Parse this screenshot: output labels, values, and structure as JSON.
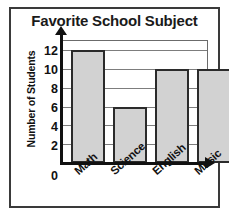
{
  "chart_data": {
    "type": "bar",
    "title": "Favorite School Subject",
    "xlabel": "",
    "ylabel": "Number of Students",
    "categories": [
      "Math",
      "Science",
      "English",
      "Music"
    ],
    "values": [
      12,
      6,
      10,
      10
    ],
    "ylim": [
      0,
      13
    ],
    "yticks": [
      0,
      2,
      4,
      6,
      8,
      10,
      12
    ],
    "ytick_labels": [
      "0",
      "2",
      "4",
      "6",
      "8",
      "10",
      "12"
    ],
    "grid": true,
    "grid_axis": "y",
    "legend": false,
    "legend_position": "none",
    "bar_fill_color": "#d2d2d2",
    "bar_edge_color": "#2b2b2b",
    "axis_color": "#111111",
    "grid_color": "#7d7d7d",
    "frame_color": "#3a3a3a",
    "axis_arrows": true,
    "xtick_rotation_degrees": -42
  }
}
